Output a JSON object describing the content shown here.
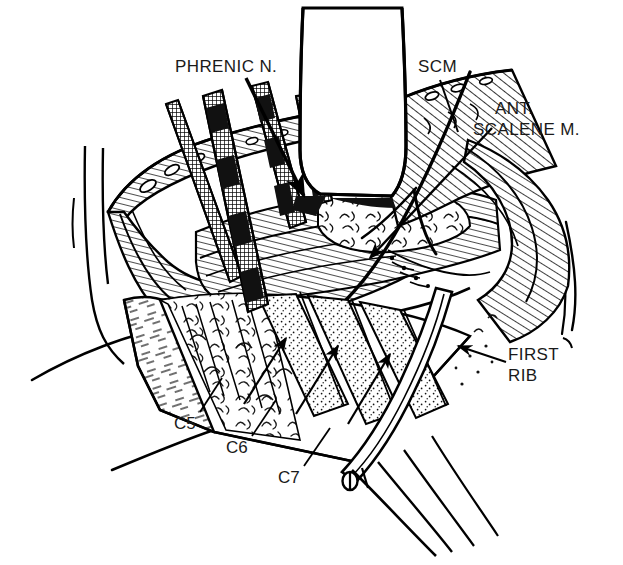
{
  "figure": {
    "kind": "anatomical-line-drawing",
    "background_color": "#ffffff",
    "ink_color": "#000000",
    "width": 623,
    "height": 565
  },
  "labels": {
    "phrenic_nerve": {
      "text": "PHRENIC N.",
      "x": 175,
      "y": 57
    },
    "scm": {
      "text": "SCM",
      "x": 418,
      "y": 57
    },
    "ant_scalene_line1": {
      "text": "ANT.",
      "x": 495,
      "y": 98
    },
    "ant_scalene_line2": {
      "text": "SCALENE M.",
      "x": 473,
      "y": 119
    },
    "first_rib_line1": {
      "text": "FIRST",
      "x": 508,
      "y": 344
    },
    "first_rib_line2": {
      "text": "RIB",
      "x": 508,
      "y": 365
    },
    "root_c5": {
      "text": "C5",
      "x": 174,
      "y": 414
    },
    "root_c6": {
      "text": "C6",
      "x": 226,
      "y": 438
    },
    "root_c7": {
      "text": "C7",
      "x": 278,
      "y": 468
    }
  }
}
